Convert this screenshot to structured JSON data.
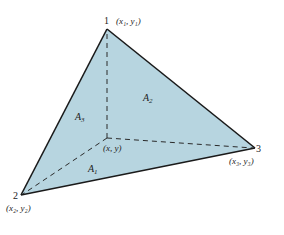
{
  "diagram": {
    "colors": {
      "fill": "#b7d5e0",
      "edge": "#1a1a1a",
      "dashed": "#2a2a2a",
      "text": "#222222",
      "background": "#ffffff"
    },
    "vertices": [
      {
        "id": "1",
        "label": "1",
        "coord_label": "(x₁, y₁)",
        "x": 107,
        "y": 29
      },
      {
        "id": "2",
        "label": "2",
        "coord_label": "(x₂, y₂)",
        "x": 21,
        "y": 195
      },
      {
        "id": "3",
        "label": "3",
        "coord_label": "(x₃, y₃)",
        "x": 255,
        "y": 148
      }
    ],
    "interior_point": {
      "label": "(x, y)",
      "x": 107,
      "y": 138
    },
    "areas": [
      {
        "id": "A1",
        "label_main": "A",
        "label_sub": "1",
        "x": 88,
        "y": 172
      },
      {
        "id": "A2",
        "label_main": "A",
        "label_sub": "2",
        "x": 143,
        "y": 101
      },
      {
        "id": "A3",
        "label_main": "A",
        "label_sub": "3",
        "x": 75,
        "y": 120
      }
    ]
  }
}
